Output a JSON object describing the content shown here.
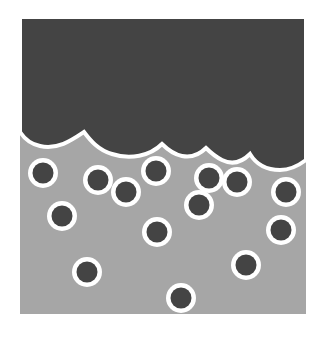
{
  "diagram": {
    "colors": {
      "background": "#ffffff",
      "upper_phase": "#444444",
      "lower_phase": "#a6a6a6",
      "interface_outline": "#ffffff",
      "particle_core": "#444444",
      "particle_shell": "#ffffff"
    },
    "particle_count": 16
  }
}
